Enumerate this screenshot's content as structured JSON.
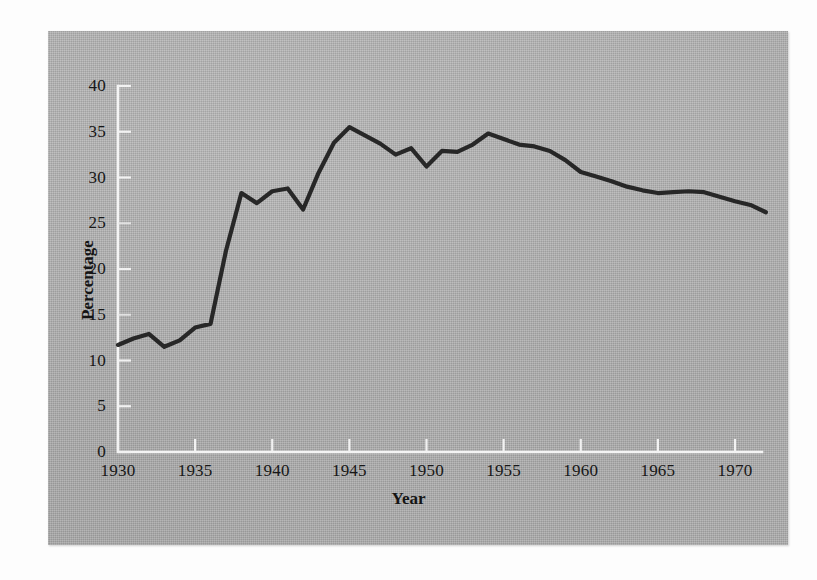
{
  "figure": {
    "panel_background_color": "#b4b4b4",
    "page_background_color": "#fdfdfd",
    "axis_color": "#f2f2f2",
    "line_color": "#1b1b1b"
  },
  "chart_data": {
    "type": "line",
    "title": "",
    "subtitle": "",
    "xlabel": "Year",
    "ylabel": "Percentage",
    "xlim": [
      1930,
      1972
    ],
    "ylim": [
      0,
      40
    ],
    "xticks": [
      1930,
      1935,
      1940,
      1945,
      1950,
      1955,
      1960,
      1965,
      1970
    ],
    "xtick_labels": [
      "1930",
      "1935",
      "1940",
      "1945",
      "1950",
      "1955",
      "1960",
      "1965",
      "1970"
    ],
    "yticks": [
      0,
      5,
      10,
      15,
      20,
      25,
      30,
      35,
      40
    ],
    "ytick_labels": [
      "0",
      "5",
      "10",
      "15",
      "20",
      "25",
      "30",
      "35",
      "40"
    ],
    "grid": false,
    "legend": null,
    "legend_position": "none",
    "annotations": [],
    "series": [
      {
        "name": "Percentage",
        "color": "#1b1b1b",
        "x": [
          1930,
          1931,
          1932,
          1933,
          1934,
          1935,
          1936,
          1937,
          1938,
          1939,
          1940,
          1941,
          1942,
          1943,
          1944,
          1945,
          1946,
          1947,
          1948,
          1949,
          1950,
          1951,
          1952,
          1953,
          1954,
          1955,
          1956,
          1957,
          1958,
          1959,
          1960,
          1961,
          1962,
          1963,
          1964,
          1965,
          1966,
          1967,
          1968,
          1969,
          1970,
          1971,
          1972
        ],
        "values": [
          11.7,
          12.4,
          12.9,
          11.5,
          12.2,
          13.6,
          14.0,
          22.0,
          28.3,
          27.2,
          28.5,
          28.8,
          26.5,
          30.5,
          33.8,
          35.5,
          34.6,
          33.7,
          32.5,
          33.2,
          31.2,
          32.9,
          32.8,
          33.6,
          34.8,
          34.2,
          33.6,
          33.4,
          32.9,
          31.9,
          30.6,
          30.1,
          29.6,
          29.0,
          28.6,
          28.3,
          28.4,
          28.5,
          28.4,
          27.9,
          27.4,
          27.0,
          26.2
        ]
      }
    ]
  },
  "axes": {
    "y_axis_title": "Percentage",
    "x_axis_title": "Year"
  }
}
